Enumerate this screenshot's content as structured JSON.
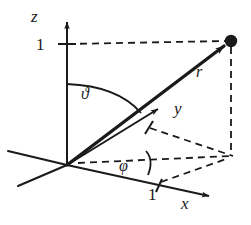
{
  "figure": {
    "stroke_color": "#1a1a1a",
    "background_color": "#ffffff",
    "dash_pattern": "7,5"
  },
  "axes": {
    "z": {
      "label": "z",
      "tick_label": "1"
    },
    "y": {
      "label": "y",
      "tick_label": "1"
    },
    "x": {
      "label": "x",
      "tick_label": "1"
    }
  },
  "vector": {
    "label": "r",
    "point_marker": "filled-dot"
  },
  "angles": {
    "polar": {
      "label": "ϑ",
      "name": "theta"
    },
    "azimuth": {
      "label": "φ",
      "name": "phi"
    }
  }
}
